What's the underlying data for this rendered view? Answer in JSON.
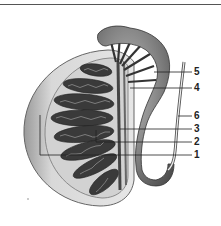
{
  "diagram": {
    "labels": [
      {
        "number": "5",
        "y": 72
      },
      {
        "number": "4",
        "y": 88
      },
      {
        "number": "6",
        "y": 116
      },
      {
        "number": "3",
        "y": 129
      },
      {
        "number": "2",
        "y": 142
      },
      {
        "number": "1",
        "y": 155
      }
    ]
  }
}
